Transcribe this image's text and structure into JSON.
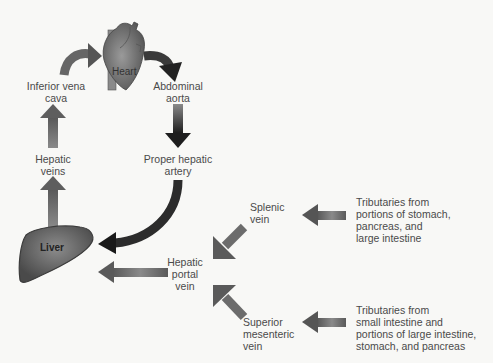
{
  "diagram": {
    "organs": {
      "heart": "Heart",
      "liver": "Liver"
    },
    "labels": {
      "inferior_vena_cava": [
        "Inferior vena",
        "cava"
      ],
      "abdominal_aorta": [
        "Abdominal",
        "aorta"
      ],
      "hepatic_veins": [
        "Hepatic",
        "veins"
      ],
      "proper_hepatic_artery": [
        "Proper hepatic",
        "artery"
      ],
      "splenic_vein": [
        "Splenic",
        "vein"
      ],
      "hepatic_portal_vein": [
        "Hepatic",
        "portal",
        "vein"
      ],
      "superior_mesenteric_vein": [
        "Superior",
        "mesenteric",
        "vein"
      ],
      "tributaries_splenic": [
        "Tributaries from",
        "portions of stomach,",
        "pancreas, and",
        "large intestine"
      ],
      "tributaries_sm": [
        "Tributaries from",
        "small intestine and",
        "portions of large intestine,",
        "stomach, and pancreas"
      ]
    },
    "flow": [
      {
        "from": "Tributaries (stomach, pancreas, large intestine)",
        "to": "Splenic vein"
      },
      {
        "from": "Tributaries (small intestine, large intestine, stomach, pancreas)",
        "to": "Superior mesenteric vein"
      },
      {
        "from": "Splenic vein",
        "to": "Hepatic portal vein"
      },
      {
        "from": "Superior mesenteric vein",
        "to": "Hepatic portal vein"
      },
      {
        "from": "Hepatic portal vein",
        "to": "Liver"
      },
      {
        "from": "Heart",
        "to": "Abdominal aorta"
      },
      {
        "from": "Abdominal aorta",
        "to": "Proper hepatic artery"
      },
      {
        "from": "Proper hepatic artery",
        "to": "Liver"
      },
      {
        "from": "Liver",
        "to": "Hepatic veins"
      },
      {
        "from": "Hepatic veins",
        "to": "Inferior vena cava"
      },
      {
        "from": "Inferior vena cava",
        "to": "Heart"
      }
    ],
    "colors": {
      "venous_arrow": "#6a6a6a",
      "arterial_arrow": "#2e2e2e",
      "heart": "#7a7a7a",
      "liver": "#6e6e6e",
      "background": "#f8f8f6"
    }
  }
}
